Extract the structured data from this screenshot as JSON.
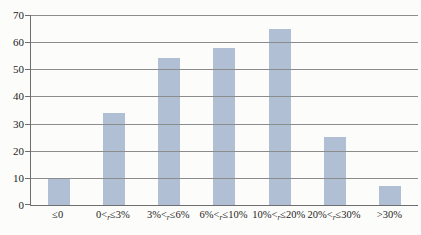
{
  "figure": {
    "background": "#fcfcfa",
    "title": ""
  },
  "chart_data": {
    "type": "bar",
    "title": "",
    "xlabel": "",
    "ylabel": "",
    "categories": [
      "≤0",
      "0<r≤3%",
      "3%<r≤6%",
      "6%<r≤10%",
      "10%<r≤20%",
      "20%<r≤30%",
      ">30%"
    ],
    "x_label_parts": [
      {
        "pre": "≤0",
        "sub": "",
        "post": ""
      },
      {
        "pre": "0<",
        "sub": "r",
        "post": "≤3%"
      },
      {
        "pre": "3%<",
        "sub": "r",
        "post": "≤6%"
      },
      {
        "pre": "6%<",
        "sub": "r",
        "post": "≤10%"
      },
      {
        "pre": "10%<",
        "sub": "r",
        "post": "≤20%"
      },
      {
        "pre": "20%<",
        "sub": "r",
        "post": "≤30%"
      },
      {
        "pre": ">30%",
        "sub": "",
        "post": ""
      }
    ],
    "values": [
      10,
      34,
      54,
      58,
      65,
      25,
      7
    ],
    "ylim": [
      0,
      70
    ],
    "yticks": [
      0,
      10,
      20,
      30,
      40,
      50,
      60,
      70
    ],
    "grid": true,
    "legend": false,
    "colors": {
      "bar_fill": "#b1bfd4",
      "gridline": "#8c8c8c",
      "axis": "#6e6e6e",
      "text": "#1c1c1c"
    }
  }
}
